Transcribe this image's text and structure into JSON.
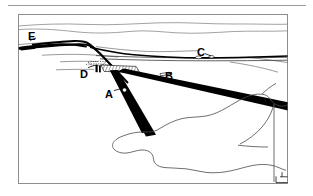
{
  "figure": {
    "kind": "annotated-oblique-aerial-line-drawing",
    "frame": {
      "x": 18,
      "y": 14,
      "width": 270,
      "height": 170
    },
    "top_rule": {
      "x": 8,
      "y": 5,
      "width": 298
    },
    "background_color": "#ffffff",
    "ink_color": "#000000",
    "frame_color": "#8d8d8d",
    "hairline_color": "#6f6f6f"
  },
  "labels": [
    {
      "id": "E",
      "text": "E",
      "x": 28,
      "y": 31
    },
    {
      "id": "D",
      "text": "D",
      "x": 80,
      "y": 69
    },
    {
      "id": "A",
      "text": "A",
      "x": 105,
      "y": 89
    },
    {
      "id": "B",
      "text": "B",
      "x": 165,
      "y": 71
    },
    {
      "id": "C",
      "text": "C",
      "x": 197,
      "y": 47
    }
  ],
  "features": {
    "horizon_lines": 2,
    "black_wedges": 3,
    "hatched_patch": 1,
    "coastline_outline": 1,
    "leader_lines": 5
  }
}
